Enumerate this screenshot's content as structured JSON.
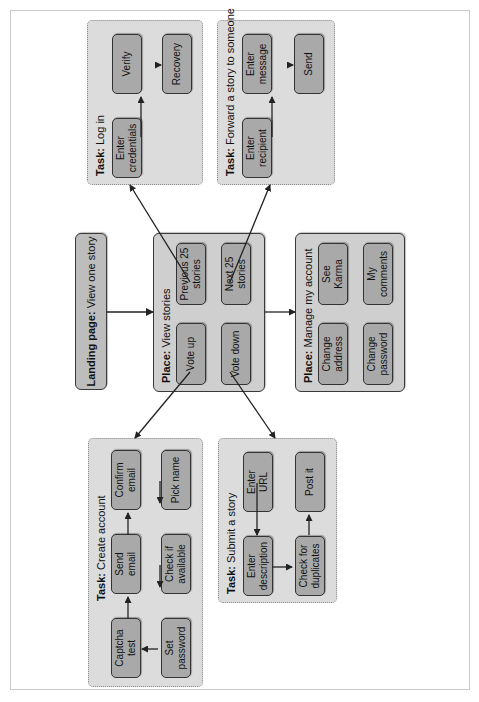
{
  "landing": {
    "label_bold": "Landing page:",
    "label": " View one story"
  },
  "places": {
    "view_stories": {
      "label_bold": "Place:",
      "label": " View stories",
      "items": [
        "Vote up",
        "Vote down",
        "Previous 25\nstories",
        "Next 25\nstories"
      ]
    },
    "manage_account": {
      "label_bold": "Place:",
      "label": " Manage my account",
      "items": [
        "Change\naddress",
        "Change\npassword",
        "See\nKarma",
        "My\ncomments"
      ]
    }
  },
  "tasks": {
    "log_in": {
      "label_bold": "Task:",
      "label": " Log in",
      "steps": [
        "Enter\ncredentials",
        "Verify",
        "Recovery"
      ]
    },
    "forward_story": {
      "label_bold": "Task:",
      "label": " Forward a story to someone",
      "steps": [
        "Enter\nrecipient",
        "Enter\nmessage",
        "Send"
      ]
    },
    "create_account": {
      "label_bold": "Task:",
      "label": " Create account",
      "steps": [
        "Captcha\ntest",
        "Send\nemail",
        "Confirm\nemail",
        "Pick name",
        "Check if\navailable",
        "Set\npassword"
      ]
    },
    "submit_story": {
      "label_bold": "Task:",
      "label": " Submit a story",
      "steps": [
        "Enter\nURL",
        "Enter\ndescription",
        "Check for\nduplicates",
        "Post it"
      ]
    }
  },
  "colors": {
    "task_bg": "#dcdcdc",
    "place_bg": "#cfcfcf",
    "node_bg": "#a9a9a9",
    "stroke": "#333333"
  }
}
